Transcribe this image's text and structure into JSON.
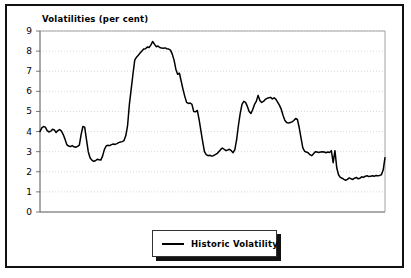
{
  "chart_data": {
    "type": "line",
    "title": "Volatilities (per cent)",
    "xlabel": "",
    "ylabel": "",
    "ylim": [
      0,
      9
    ],
    "yticks": [
      0,
      1,
      2,
      3,
      4,
      5,
      6,
      7,
      8,
      9
    ],
    "ytick_labels": [
      "0",
      "1",
      "2",
      "3",
      "4",
      "5",
      "6",
      "7",
      "8",
      "9"
    ],
    "xticks": [],
    "xtick_labels": [],
    "grid": "horizontal-dotted",
    "legend_position": "below-center",
    "line_color": "#000000",
    "series": [
      {
        "name": "Historic Volatility",
        "values": [
          4.0,
          4.18,
          4.25,
          4.22,
          4.05,
          3.98,
          4.02,
          4.12,
          4.08,
          3.95,
          4.05,
          4.1,
          4.02,
          3.85,
          3.62,
          3.35,
          3.28,
          3.25,
          3.3,
          3.24,
          3.22,
          3.26,
          3.32,
          3.85,
          4.25,
          4.22,
          3.6,
          3.0,
          2.7,
          2.58,
          2.52,
          2.55,
          2.62,
          2.6,
          2.58,
          2.78,
          3.1,
          3.28,
          3.32,
          3.3,
          3.35,
          3.38,
          3.36,
          3.4,
          3.45,
          3.48,
          3.5,
          3.55,
          3.8,
          4.3,
          5.35,
          6.1,
          6.85,
          7.55,
          7.7,
          7.8,
          7.9,
          8.0,
          8.1,
          8.12,
          8.2,
          8.18,
          8.3,
          8.48,
          8.35,
          8.22,
          8.25,
          8.18,
          8.15,
          8.14,
          8.16,
          8.12,
          8.1,
          8.05,
          7.85,
          7.55,
          7.1,
          6.85,
          6.9,
          6.5,
          6.1,
          5.75,
          5.45,
          5.4,
          5.42,
          5.35,
          5.0,
          4.98,
          5.05,
          4.6,
          4.05,
          3.5,
          3.0,
          2.85,
          2.8,
          2.82,
          2.78,
          2.8,
          2.85,
          2.9,
          3.0,
          3.1,
          3.18,
          3.12,
          3.05,
          3.08,
          3.12,
          3.05,
          2.95,
          3.1,
          3.6,
          4.3,
          4.9,
          5.35,
          5.5,
          5.45,
          5.25,
          5.0,
          4.9,
          5.1,
          5.35,
          5.5,
          5.8,
          5.55,
          5.45,
          5.5,
          5.6,
          5.65,
          5.68,
          5.7,
          5.62,
          5.68,
          5.6,
          5.45,
          5.3,
          5.1,
          4.8,
          4.55,
          4.45,
          4.42,
          4.45,
          4.48,
          4.55,
          4.65,
          4.6,
          4.2,
          3.7,
          3.2,
          3.02,
          2.98,
          2.95,
          2.85,
          2.8,
          2.9,
          3.0,
          2.98,
          2.96,
          2.98,
          3.0,
          2.98,
          2.95,
          2.98,
          2.96,
          3.05,
          2.45,
          3.05,
          2.2,
          1.85,
          1.72,
          1.68,
          1.62,
          1.58,
          1.62,
          1.7,
          1.65,
          1.62,
          1.68,
          1.72,
          1.65,
          1.68,
          1.75,
          1.72,
          1.78,
          1.8,
          1.76,
          1.78,
          1.8,
          1.78,
          1.82,
          1.8,
          1.82,
          1.85,
          2.1,
          2.7
        ]
      }
    ]
  },
  "legend": {
    "entries": [
      {
        "label": "Historic Volatility"
      }
    ]
  }
}
